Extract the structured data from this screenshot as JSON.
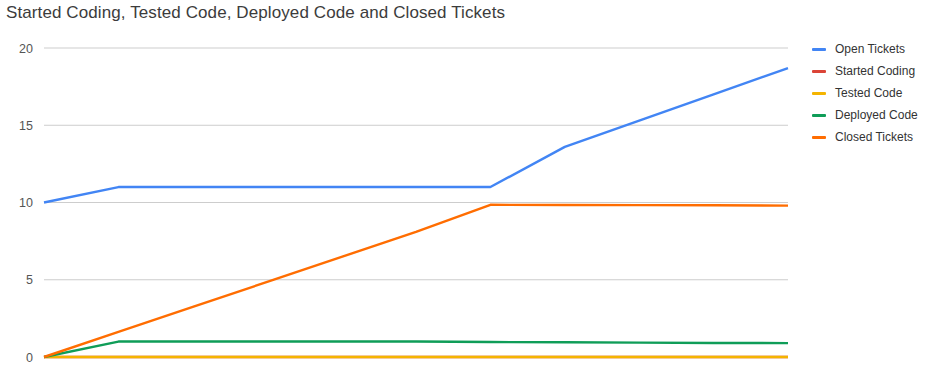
{
  "chart_data": {
    "type": "line",
    "title": "Started Coding, Tested Code, Deployed Code and Closed Tickets",
    "xlabel": "",
    "ylabel": "",
    "ylim": [
      0,
      20
    ],
    "xlim": [
      0,
      10
    ],
    "grid": true,
    "legend_position": "right",
    "y_ticks": [
      "0",
      "5",
      "10",
      "15",
      "20"
    ],
    "y_tick_values": [
      0,
      5,
      10,
      15,
      20
    ],
    "x": [
      0,
      1,
      2,
      3,
      4,
      5,
      6,
      7,
      8,
      9,
      10
    ],
    "series": [
      {
        "name": "Open Tickets",
        "color": "#4285F4",
        "values": [
          10,
          11,
          11,
          11,
          11,
          11,
          11,
          13.6,
          15.3,
          17,
          18.7
        ]
      },
      {
        "name": "Started Coding",
        "color": "#DB4437",
        "values": [
          0,
          0,
          0,
          0,
          0,
          0,
          0,
          0,
          0,
          0,
          0
        ]
      },
      {
        "name": "Tested Code",
        "color": "#F4B400",
        "values": [
          0,
          0,
          0,
          0,
          0,
          0,
          0,
          0,
          0,
          0,
          0
        ]
      },
      {
        "name": "Deployed Code",
        "color": "#0F9D58",
        "values": [
          0,
          1,
          1,
          1,
          1,
          1,
          0.97,
          0.95,
          0.93,
          0.91,
          0.9
        ]
      },
      {
        "name": "Closed Tickets",
        "color": "#FF6D01",
        "values": [
          0,
          1.62,
          3.24,
          4.86,
          6.48,
          8.1,
          9.85,
          9.84,
          9.83,
          9.82,
          9.8
        ]
      }
    ]
  },
  "legend": {
    "items": [
      {
        "label": "Open Tickets",
        "color": "#4285F4"
      },
      {
        "label": "Started Coding",
        "color": "#DB4437"
      },
      {
        "label": "Tested Code",
        "color": "#F4B400"
      },
      {
        "label": "Deployed Code",
        "color": "#0F9D58"
      },
      {
        "label": "Closed Tickets",
        "color": "#FF6D01"
      }
    ]
  }
}
